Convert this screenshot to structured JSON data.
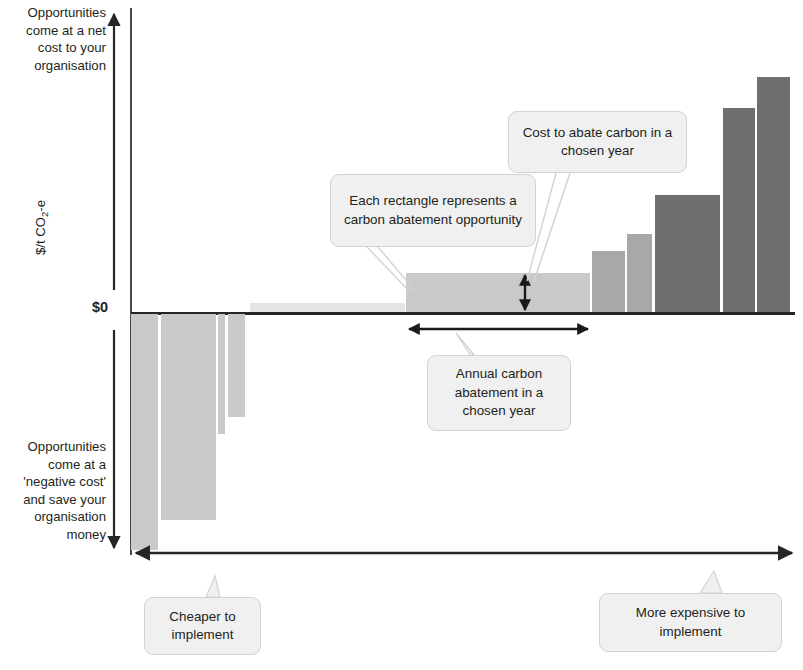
{
  "figure": {
    "axis_notes": {
      "top": "Opportunities come at a net cost to your organisation",
      "bottom": "Opportunities come at a 'negative cost' and save your organisation money"
    },
    "zero_label": "$0",
    "y_axis_title": "$/t CO",
    "y_axis_title_sub": "2",
    "y_axis_title_tail": "-e"
  },
  "callouts": {
    "each_rectangle": "Each rectangle represents a carbon abatement opportunity",
    "cost_to_abate": "Cost to abate carbon in a chosen year",
    "annual_abatement": "Annual carbon abatement in a chosen year",
    "cheaper": "Cheaper to implement",
    "more_expensive": "More expensive to implement"
  },
  "colors": {
    "bar_very_light": "#e4e4e4",
    "bar_light": "#c9c9c9",
    "bar_medium": "#a8a8a8",
    "bar_dark": "#6f6f6f",
    "axis": "#262626",
    "callout_bg": "#f0f0f0",
    "callout_border": "#d2d2d2",
    "text": "#231f20"
  },
  "chart_data": {
    "type": "bar",
    "xlabel": "Annual carbon abatement in a chosen year (cumulative)",
    "ylabel": "$/t CO2-e",
    "grid": false,
    "legend": false,
    "notes": [
      "Bar width represents annual carbon abatement in a chosen year",
      "Bar height represents cost to abate carbon in a chosen year"
    ],
    "axis_zero_label": "$0",
    "x_direction_label_left": "Cheaper to implement",
    "x_direction_label_right": "More expensive to implement",
    "bars": [
      {
        "id": 1,
        "x_start": 131,
        "x_end": 158,
        "value": -236,
        "shade": "light"
      },
      {
        "id": 2,
        "x_start": 161,
        "x_end": 216,
        "value": -206,
        "shade": "light"
      },
      {
        "id": 3,
        "x_start": 218,
        "x_end": 225,
        "value": -120,
        "shade": "light"
      },
      {
        "id": 4,
        "x_start": 228,
        "x_end": 245,
        "value": -103,
        "shade": "light"
      },
      {
        "id": 5,
        "x_start": 250,
        "x_end": 405,
        "value": 9,
        "shade": "very_light"
      },
      {
        "id": 6,
        "x_start": 406,
        "x_end": 590,
        "value": 39,
        "shade": "light"
      },
      {
        "id": 7,
        "x_start": 592,
        "x_end": 625,
        "value": 61,
        "shade": "medium"
      },
      {
        "id": 8,
        "x_start": 627,
        "x_end": 652,
        "value": 78,
        "shade": "medium"
      },
      {
        "id": 9,
        "x_start": 655,
        "x_end": 720,
        "value": 117,
        "shade": "dark"
      },
      {
        "id": 10,
        "x_start": 723,
        "x_end": 755,
        "value": 204,
        "shade": "dark"
      },
      {
        "id": 11,
        "x_start": 757,
        "x_end": 790,
        "value": 235,
        "shade": "dark"
      }
    ],
    "unit": "$/t CO2-e (relative units read off pixel scale)"
  }
}
